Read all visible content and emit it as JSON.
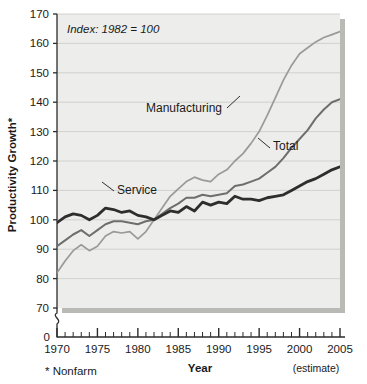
{
  "chart_data": {
    "type": "line",
    "title": "",
    "note": "Index: 1982 = 100",
    "xlabel": "Year",
    "ylabel": "Productivity Growth*",
    "footnote": "* Nonfarm",
    "x_estimate_note": "(estimate)",
    "xlim": [
      1970,
      2005
    ],
    "ylim": [
      70,
      170
    ],
    "y_axis_break": true,
    "y_break_base": 0,
    "y_ticks": [
      70,
      80,
      90,
      100,
      110,
      120,
      130,
      140,
      150,
      160,
      170
    ],
    "y_zero_label": "0",
    "x_ticks": [
      1970,
      1975,
      1980,
      1985,
      1990,
      1995,
      2000,
      2005
    ],
    "x_minor_tick_interval": 1,
    "grid": "horizontal",
    "legend": "inline-annotations",
    "x": [
      1970,
      1971,
      1972,
      1973,
      1974,
      1975,
      1976,
      1977,
      1978,
      1979,
      1980,
      1981,
      1982,
      1983,
      1984,
      1985,
      1986,
      1987,
      1988,
      1989,
      1990,
      1991,
      1992,
      1993,
      1994,
      1995,
      1996,
      1997,
      1998,
      1999,
      2000,
      2001,
      2002,
      2003,
      2004,
      2005
    ],
    "series": [
      {
        "name": "Manufacturing",
        "color": "#9a9a9a",
        "width": 1.7,
        "values": [
          82,
          86,
          89.5,
          91.5,
          89.5,
          91,
          94.5,
          96,
          95.5,
          96,
          93.5,
          96,
          100,
          104,
          108,
          110.5,
          113,
          114.5,
          113.5,
          113,
          115.5,
          117,
          120,
          122.5,
          126,
          130,
          135.5,
          141.5,
          147.5,
          152.5,
          156.5,
          158.5,
          160.5,
          162,
          163,
          164
        ]
      },
      {
        "name": "Total",
        "color": "#6e6e6e",
        "width": 2.0,
        "values": [
          91,
          93,
          95,
          96.5,
          94.5,
          96.5,
          98.5,
          99.5,
          99.5,
          99,
          98.5,
          99.5,
          100,
          102,
          104,
          105.5,
          107.5,
          107.5,
          108.5,
          108,
          108.5,
          109,
          111.5,
          112,
          113,
          114,
          116,
          118,
          121,
          124.5,
          127.5,
          130.5,
          134.5,
          137.5,
          140,
          141
        ]
      },
      {
        "name": "Service",
        "color": "#2e2e2e",
        "width": 2.8,
        "values": [
          99,
          101,
          102,
          101.5,
          100,
          101.5,
          104,
          103.5,
          102.5,
          103,
          101.5,
          101,
          100,
          101.5,
          103,
          102.5,
          104.5,
          103,
          106,
          105,
          106,
          105.5,
          108,
          107,
          107,
          106.5,
          107.5,
          108,
          108.5,
          110,
          111.5,
          113,
          114,
          115.5,
          117,
          118
        ]
      }
    ],
    "annotations": [
      {
        "label": "Manufacturing",
        "x": 146,
        "y": 112
      },
      {
        "label": "Total",
        "x": 273,
        "y": 150
      },
      {
        "label": "Service",
        "x": 117,
        "y": 194
      }
    ]
  },
  "style": {
    "plot_bg": "#ededeb",
    "grid_color": "#c9c9c5",
    "axis_color": "#2b2b2b",
    "shadow_color": "#b9b9b5",
    "page_bg": "#ffffff"
  }
}
